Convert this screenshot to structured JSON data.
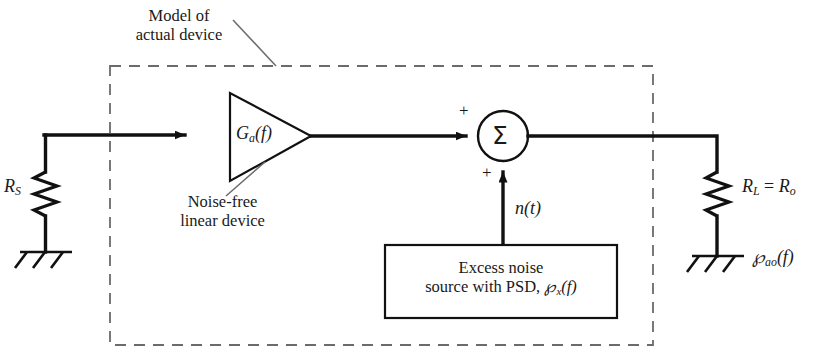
{
  "figure": {
    "type": "block-diagram",
    "background_color": "#ffffff",
    "line_color": "#111111",
    "dashed_color": "#666666"
  },
  "annotations": {
    "model_label_line1": "Model of",
    "model_label_line2": "actual device",
    "device_label_line1": "Noise-free",
    "device_label_line2": "linear device"
  },
  "components": {
    "source_resistor": {
      "name": "source-resistor",
      "label_r": "R",
      "label_sub": "S"
    },
    "amplifier": {
      "name": "amplifier-triangle",
      "gain_g": "G",
      "gain_sub": "a",
      "gain_arg": "(f)"
    },
    "summer": {
      "name": "summing-junction",
      "symbol": "Σ",
      "input_plus_left": "+",
      "input_plus_bottom": "+"
    },
    "noise_signal": {
      "name": "noise-signal-label",
      "n": "n",
      "arg": "(t)"
    },
    "noise_source_box": {
      "name": "excess-noise-source-box",
      "line1": "Excess noise",
      "line2_a": "source with PSD, ",
      "psd_symbol": "℘",
      "psd_sub": "x",
      "psd_arg": "(f)"
    },
    "load_resistor": {
      "name": "load-resistor",
      "label_rl": "R",
      "label_rl_sub": "L",
      "equals": " = ",
      "label_ro": "R",
      "label_ro_sub": "o"
    },
    "output_psd": {
      "name": "output-psd-label",
      "psd_symbol": "℘",
      "psd_sub": "ao",
      "psd_arg": "(f)"
    },
    "ground_left": {
      "name": "ground-symbol-left"
    },
    "ground_right": {
      "name": "ground-symbol-right"
    }
  }
}
